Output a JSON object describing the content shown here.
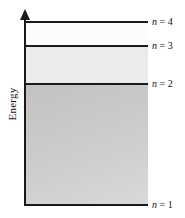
{
  "diagram": {
    "axis": {
      "label": "Energy",
      "arrow_direction": "up"
    },
    "levels": [
      {
        "id": "n4",
        "symbol": "n",
        "equals": "=",
        "value": "4",
        "label": "n = 4"
      },
      {
        "id": "n3",
        "symbol": "n",
        "equals": "=",
        "value": "3",
        "label": "n = 3"
      },
      {
        "id": "n2",
        "symbol": "n",
        "equals": "=",
        "value": "2",
        "label": "n = 2"
      },
      {
        "id": "n1",
        "symbol": "n",
        "equals": "=",
        "value": "1",
        "label": "n = 1"
      }
    ],
    "bands": [
      {
        "id": "n4-n3",
        "between": "n = 4 and n = 3",
        "fill": "#fcfcfc"
      },
      {
        "id": "n3-n2",
        "between": "n = 3 and n = 2",
        "fill": "#ebebeb"
      },
      {
        "id": "n2-n1",
        "between": "n = 2 and n = 1",
        "fill": "#c8c8c8"
      }
    ],
    "colors": {
      "line": "#1a1a1a",
      "text": "#111111",
      "background": "#ffffff"
    }
  },
  "chart_data": {
    "type": "line",
    "xlabel": "",
    "ylabel": "Energy",
    "categories": [
      "n = 1",
      "n = 2",
      "n = 3",
      "n = 4"
    ],
    "values": [
      1,
      2,
      3,
      4
    ],
    "annotations": [
      "n = 4",
      "n = 3",
      "n = 2",
      "n = 1"
    ],
    "grid": false,
    "legend": "none"
  }
}
